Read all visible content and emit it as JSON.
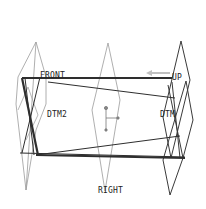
{
  "viewport": {
    "background": "#ffffff",
    "datum_plane_color": "#9a9a9a",
    "edge_color": "#333333",
    "highlight_color": "#bdbdbd"
  },
  "datum_planes": [
    {
      "name": "FRONT",
      "label": "FRONT"
    },
    {
      "name": "TOP",
      "label": "UP"
    },
    {
      "name": "DTM1",
      "label": "DTM"
    },
    {
      "name": "DTM2",
      "label": "DTM2"
    },
    {
      "name": "RIGHT",
      "label": "RIGHT"
    }
  ],
  "icons": {
    "coordinate_system": "csys-icon",
    "direction_arrow": "arrow-left-icon"
  }
}
